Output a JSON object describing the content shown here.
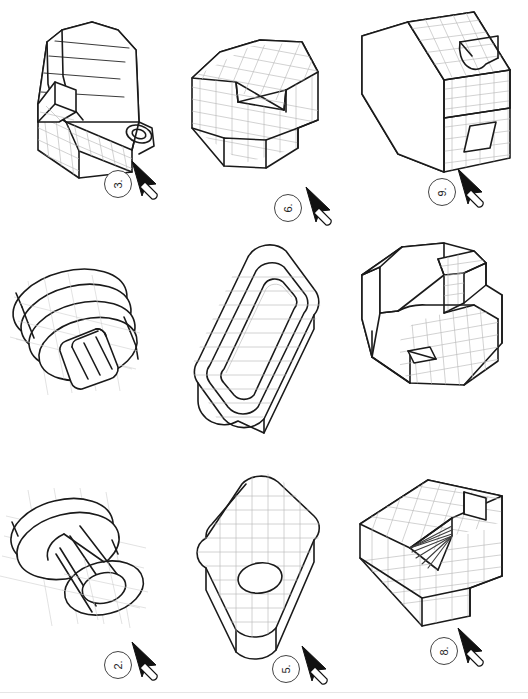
{
  "page": {
    "sheet_width": 528,
    "sheet_height": 699,
    "background_color": "#ffffff",
    "line_color": "#1a1a1a",
    "grid_color": "#b9b9b9",
    "layout": {
      "columns": 3,
      "rows": 3
    }
  },
  "figures": [
    {
      "number": "3.",
      "badge_label": "3.",
      "cursor_icon": "stylus-pointer-icon",
      "shape_name": "quarter-round-block-with-boss-and-slot",
      "description": "Isometric block with large cylindrical quarter-round top, rectangular notch at left and circular boss with hole on right face",
      "grid_lines": true,
      "position": {
        "col": 1,
        "row": 1
      }
    },
    {
      "number": "6.",
      "badge_label": "6.",
      "cursor_icon": "stylus-pointer-icon",
      "shape_name": "hexagonal-block-with-vee-notch",
      "description": "Isometric hexagonal prism with a deep vee-shaped notch cut into the top face and a rectangular step at lower right",
      "grid_lines": true,
      "position": {
        "col": 2,
        "row": 1
      }
    },
    {
      "number": "9.",
      "badge_label": "9.",
      "cursor_icon": "stylus-pointer-icon",
      "shape_name": "cube-with-stepped-face-and-slot",
      "description": "Isometric cube with a stepped recess on the right face, a quarter-round cutout at top and a rectangular through slot",
      "grid_lines": true,
      "position": {
        "col": 3,
        "row": 1
      }
    },
    {
      "number": "2.",
      "badge_label": "2.",
      "cursor_icon": "stylus-pointer-icon",
      "shape_name": "stepped-cylindrical-disc-with-key-slot",
      "description": "Isometric stacked elliptical discs forming a stepped cylinder with a rounded key slot protruding at the bottom front",
      "grid_lines": true,
      "position": {
        "col": 1,
        "row": 2
      }
    },
    {
      "number": "5.",
      "badge_label": "5.",
      "cursor_icon": "stylus-pointer-icon",
      "shape_name": "obround-u-channel",
      "description": "Isometric obround (stadium-shaped) extrusion with a concentric U-shaped channel recessed into the top",
      "grid_lines": true,
      "position": {
        "col": 2,
        "row": 2
      }
    },
    {
      "number": "8.",
      "badge_label": "8.",
      "cursor_icon": "stylus-pointer-icon",
      "shape_name": "angled-bracket-with-square-hole",
      "description": "Isometric bracket with inclined top surface, raised rib at rear and a small square hole on the sloped face",
      "grid_lines": true,
      "position": {
        "col": 3,
        "row": 2
      }
    },
    {
      "number": "1.",
      "badge_label": "1.",
      "cursor_icon": "stylus-pointer-icon",
      "shape_name": "flanged-cylindrical-bushing",
      "description": "Isometric flanged bushing: large circular flange with a smaller cylindrical body and a concentric bore through the front face",
      "grid_lines": true,
      "position": {
        "col": 1,
        "row": 3
      }
    },
    {
      "number": "4.",
      "badge_label": "4.",
      "cursor_icon": "stylus-pointer-icon",
      "shape_name": "rounded-rectangular-block-with-bore",
      "description": "Isometric rounded-corner rectangular block with a single circular bore centred on the front face",
      "grid_lines": true,
      "position": {
        "col": 2,
        "row": 3
      }
    },
    {
      "number": "7.",
      "badge_label": "7.",
      "cursor_icon": "stylus-pointer-icon",
      "shape_name": "vee-block-with-rectangular-slot",
      "description": "Isometric vee-block with a tapered vee groove across the top and a rectangular slot at the upper right",
      "grid_lines": true,
      "position": {
        "col": 3,
        "row": 3
      }
    }
  ]
}
